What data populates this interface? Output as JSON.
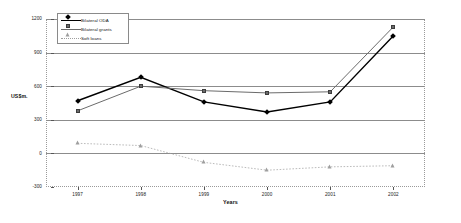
{
  "chart_data": {
    "type": "line",
    "title": "",
    "xlabel": "Years",
    "ylabel": "US$m.",
    "categories": [
      "1997",
      "1998",
      "1999",
      "2000",
      "2001",
      "2002"
    ],
    "ylim": [
      -300,
      1200
    ],
    "yticks": [
      "1200",
      "900",
      "600",
      "300",
      "0",
      "-300"
    ],
    "ytick_values": [
      1200,
      900,
      600,
      300,
      0,
      -300
    ],
    "grid": true,
    "legend_position": "top-left",
    "series": [
      {
        "name": "Bilateral ODA",
        "marker": "diamond",
        "color": "#000000",
        "values": [
          470,
          680,
          460,
          370,
          460,
          1050
        ]
      },
      {
        "name": "Bilateral grants",
        "marker": "square",
        "color": "#6b6b6b",
        "values": [
          380,
          600,
          560,
          540,
          550,
          1130
        ]
      },
      {
        "name": "Soft loans",
        "marker": "triangle",
        "color": "#9e9e9e",
        "values": [
          90,
          70,
          -80,
          -150,
          -120,
          -110
        ]
      }
    ]
  },
  "legend": {
    "items": [
      {
        "label": "Bilateral ODA"
      },
      {
        "label": "Bilateral grants"
      },
      {
        "label": "Soft loans"
      }
    ]
  },
  "axes": {
    "y_title": "US$m.",
    "x_title": "Years"
  }
}
